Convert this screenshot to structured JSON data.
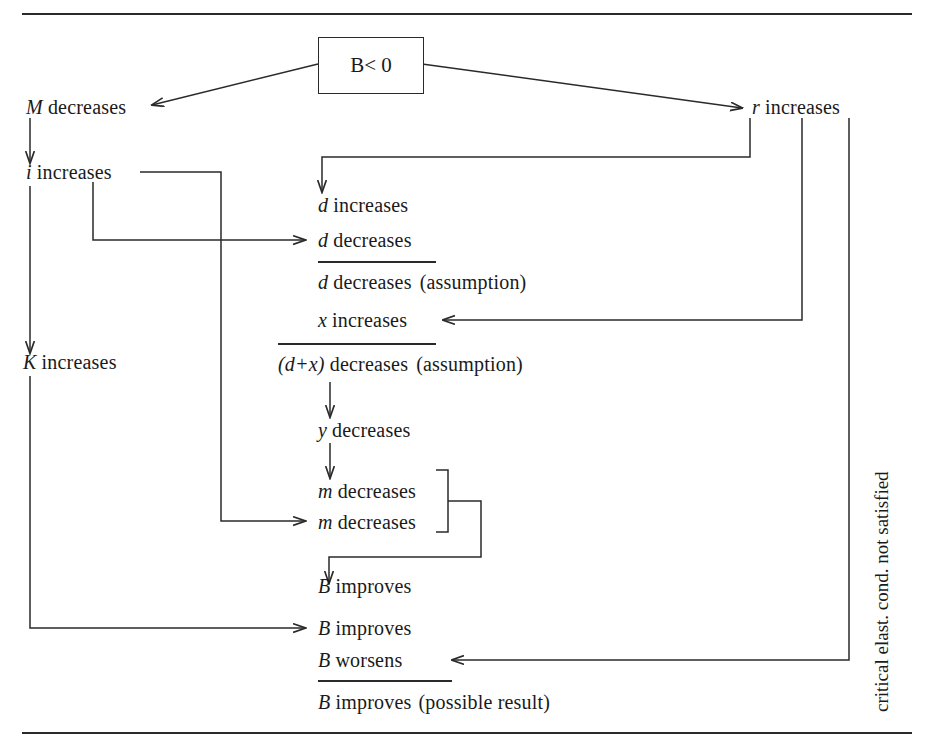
{
  "figure": {
    "type": "flow-diagram",
    "title_box": {
      "symbol": "B",
      "relation": "< 0",
      "full": "B < 0"
    },
    "top_rule": true,
    "bottom_rule": true,
    "side_label": {
      "prefix": "critical elast. cond. ",
      "emphasis": "not",
      "suffix": " satisfied",
      "full": "critical elast. cond. not satisfied",
      "orientation": "vertical-bottom-to-top"
    },
    "nodes": [
      {
        "id": "m-decreases",
        "symbol": "M",
        "text": "decreases",
        "suffix": ""
      },
      {
        "id": "r-increases",
        "symbol": "r",
        "text": "increases",
        "suffix": ""
      },
      {
        "id": "i-increases",
        "symbol": "i",
        "text": "increases",
        "suffix": ""
      },
      {
        "id": "k-increases",
        "symbol": "K",
        "text": "increases",
        "suffix": ""
      },
      {
        "id": "d-increases",
        "symbol": "d",
        "text": "increases",
        "suffix": ""
      },
      {
        "id": "d-decreases",
        "symbol": "d",
        "text": "decreases",
        "suffix": ""
      },
      {
        "id": "d-decreases-sum",
        "symbol": "d",
        "text": "decreases",
        "suffix": "(assumption)"
      },
      {
        "id": "x-increases",
        "symbol": "x",
        "text": "increases",
        "suffix": ""
      },
      {
        "id": "dx-sum",
        "symbol": "(d+x)",
        "text": "decreases",
        "suffix": "(assumption)"
      },
      {
        "id": "y-decreases",
        "symbol": "y",
        "text": "decreases",
        "suffix": ""
      },
      {
        "id": "m1-decreases",
        "symbol": "m",
        "text": "decreases",
        "suffix": ""
      },
      {
        "id": "m2-decreases",
        "symbol": "m",
        "text": "decreases",
        "suffix": ""
      },
      {
        "id": "b1-improves",
        "symbol": "B",
        "text": "improves",
        "suffix": ""
      },
      {
        "id": "b2-improves",
        "symbol": "B",
        "text": "improves",
        "suffix": ""
      },
      {
        "id": "b-worsens",
        "symbol": "B",
        "text": "worsens",
        "suffix": ""
      },
      {
        "id": "b-result",
        "symbol": "B",
        "text": "improves",
        "suffix": "(possible result)"
      }
    ],
    "colors": {
      "line": "#2a2a2a",
      "text": "#1a1a1a",
      "background": "#ffffff"
    }
  }
}
